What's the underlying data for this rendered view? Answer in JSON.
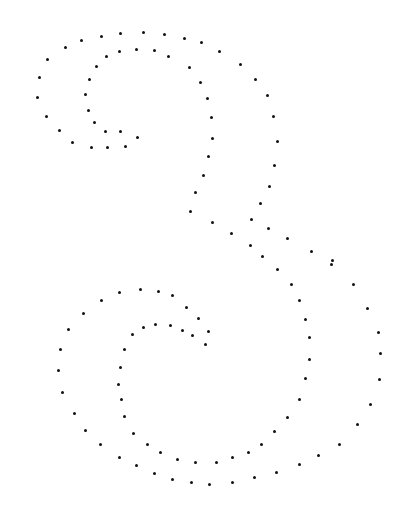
{
  "figure": {
    "dot_color": "#111111",
    "background": "#ffffff",
    "dots": [
      [
        47,
        59
      ],
      [
        39,
        77
      ],
      [
        37,
        97
      ],
      [
        46,
        116
      ],
      [
        59,
        130
      ],
      [
        72,
        142
      ],
      [
        91,
        147
      ],
      [
        107,
        147
      ],
      [
        125,
        146
      ],
      [
        137,
        137
      ],
      [
        120,
        131
      ],
      [
        105,
        131
      ],
      [
        94,
        122
      ],
      [
        88,
        110
      ],
      [
        85,
        94
      ],
      [
        89,
        79
      ],
      [
        96,
        66
      ],
      [
        106,
        56
      ],
      [
        119,
        51
      ],
      [
        136,
        49
      ],
      [
        154,
        50
      ],
      [
        168,
        56
      ],
      [
        189,
        67
      ],
      [
        200,
        82
      ],
      [
        207,
        98
      ],
      [
        211,
        117
      ],
      [
        212,
        138
      ],
      [
        208,
        156
      ],
      [
        203,
        175
      ],
      [
        195,
        192
      ],
      [
        190,
        211
      ],
      [
        212,
        222
      ],
      [
        231,
        233
      ],
      [
        250,
        245
      ],
      [
        262,
        256
      ],
      [
        65,
        47
      ],
      [
        81,
        40
      ],
      [
        101,
        36
      ],
      [
        120,
        33
      ],
      [
        143,
        32
      ],
      [
        164,
        34
      ],
      [
        184,
        38
      ],
      [
        201,
        42
      ],
      [
        219,
        51
      ],
      [
        240,
        64
      ],
      [
        255,
        79
      ],
      [
        267,
        95
      ],
      [
        273,
        116
      ],
      [
        277,
        141
      ],
      [
        274,
        165
      ],
      [
        269,
        186
      ],
      [
        260,
        203
      ],
      [
        251,
        219
      ],
      [
        268,
        228
      ],
      [
        287,
        238
      ],
      [
        311,
        251
      ],
      [
        332,
        260
      ],
      [
        277,
        269
      ],
      [
        291,
        284
      ],
      [
        299,
        300
      ],
      [
        305,
        319
      ],
      [
        309,
        337
      ],
      [
        309,
        359
      ],
      [
        305,
        378
      ],
      [
        299,
        399
      ],
      [
        287,
        417
      ],
      [
        274,
        431
      ],
      [
        261,
        444
      ],
      [
        248,
        452
      ],
      [
        232,
        457
      ],
      [
        216,
        462
      ],
      [
        195,
        462
      ],
      [
        177,
        459
      ],
      [
        160,
        452
      ],
      [
        147,
        444
      ],
      [
        133,
        433
      ],
      [
        124,
        416
      ],
      [
        121,
        399
      ],
      [
        118,
        384
      ],
      [
        120,
        367
      ],
      [
        124,
        349
      ],
      [
        132,
        334
      ],
      [
        143,
        327
      ],
      [
        155,
        324
      ],
      [
        170,
        325
      ],
      [
        182,
        330
      ],
      [
        192,
        335
      ],
      [
        205,
        344
      ],
      [
        208,
        331
      ],
      [
        198,
        318
      ],
      [
        186,
        307
      ],
      [
        172,
        295
      ],
      [
        158,
        291
      ],
      [
        140,
        289
      ],
      [
        119,
        292
      ],
      [
        101,
        300
      ],
      [
        83,
        313
      ],
      [
        68,
        329
      ],
      [
        60,
        349
      ],
      [
        58,
        370
      ],
      [
        62,
        392
      ],
      [
        74,
        413
      ],
      [
        85,
        430
      ],
      [
        100,
        444
      ],
      [
        119,
        457
      ],
      [
        136,
        465
      ],
      [
        154,
        473
      ],
      [
        172,
        479
      ],
      [
        191,
        482
      ],
      [
        209,
        484
      ],
      [
        232,
        482
      ],
      [
        254,
        477
      ],
      [
        276,
        472
      ],
      [
        299,
        464
      ],
      [
        318,
        455
      ],
      [
        339,
        444
      ],
      [
        357,
        424
      ],
      [
        370,
        404
      ],
      [
        379,
        379
      ],
      [
        380,
        353
      ],
      [
        378,
        332
      ],
      [
        367,
        308
      ],
      [
        353,
        284
      ],
      [
        331,
        264
      ]
    ]
  }
}
